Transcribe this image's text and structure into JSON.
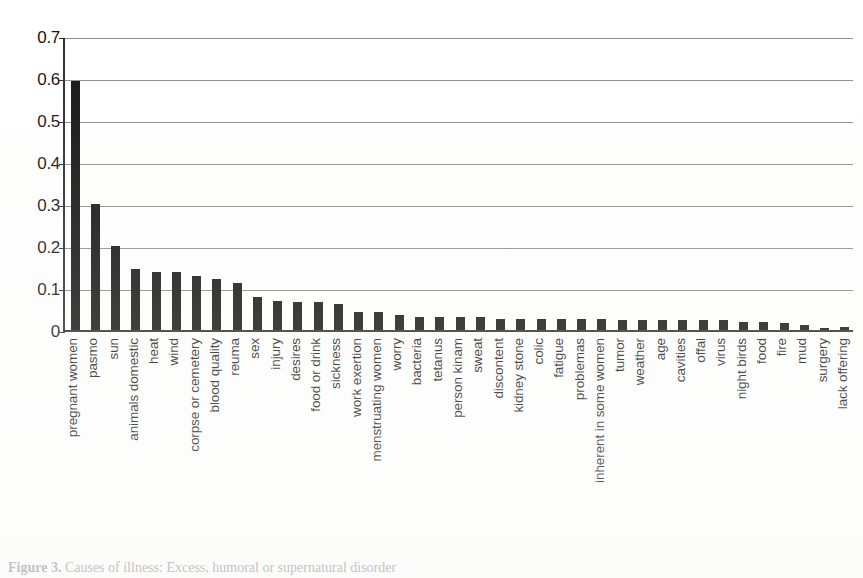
{
  "chart_data": {
    "type": "bar",
    "title": "",
    "xlabel": "",
    "ylabel": "",
    "ylim": [
      0,
      0.7
    ],
    "grid": true,
    "legend": "none",
    "orientation": "vertical",
    "bar_color": "#111111",
    "ytick_labels": [
      "0.7",
      "0.6",
      "0.5",
      "0.4",
      "0.3",
      "0.2",
      "0.1",
      "0"
    ],
    "ytick_values": [
      0.7,
      0.6,
      0.5,
      0.4,
      0.3,
      0.2,
      0.1,
      0
    ],
    "categories": [
      "pregnant women",
      "pasmo",
      "sun",
      "animals domestic",
      "heat",
      "wind",
      "corpse or cemetery",
      "blood quality",
      "reuma",
      "sex",
      "injury",
      "desires",
      "food or drink",
      "sickness",
      "work exertion",
      "menstruating women",
      "worry",
      "bacteria",
      "tetanus",
      "person kinam",
      "sweat",
      "discontent",
      "kidney stone",
      "colic",
      "fatigue",
      "problemas",
      "inherent in some women",
      "tumor",
      "weather",
      "age",
      "cavities",
      "offal",
      "virus",
      "night birds",
      "food",
      "fire",
      "mud",
      "surgery",
      "lack offering"
    ],
    "values": [
      0.593,
      0.299,
      0.199,
      0.145,
      0.137,
      0.137,
      0.129,
      0.121,
      0.113,
      0.078,
      0.07,
      0.066,
      0.066,
      0.062,
      0.043,
      0.043,
      0.035,
      0.031,
      0.031,
      0.031,
      0.031,
      0.027,
      0.027,
      0.027,
      0.027,
      0.027,
      0.027,
      0.023,
      0.023,
      0.023,
      0.023,
      0.023,
      0.023,
      0.02,
      0.02,
      0.016,
      0.012,
      0.004,
      0.006
    ]
  },
  "caption": {
    "label": "Figure 3.",
    "text": "Causes of illness: Excess, humoral or supernatural disorder"
  }
}
